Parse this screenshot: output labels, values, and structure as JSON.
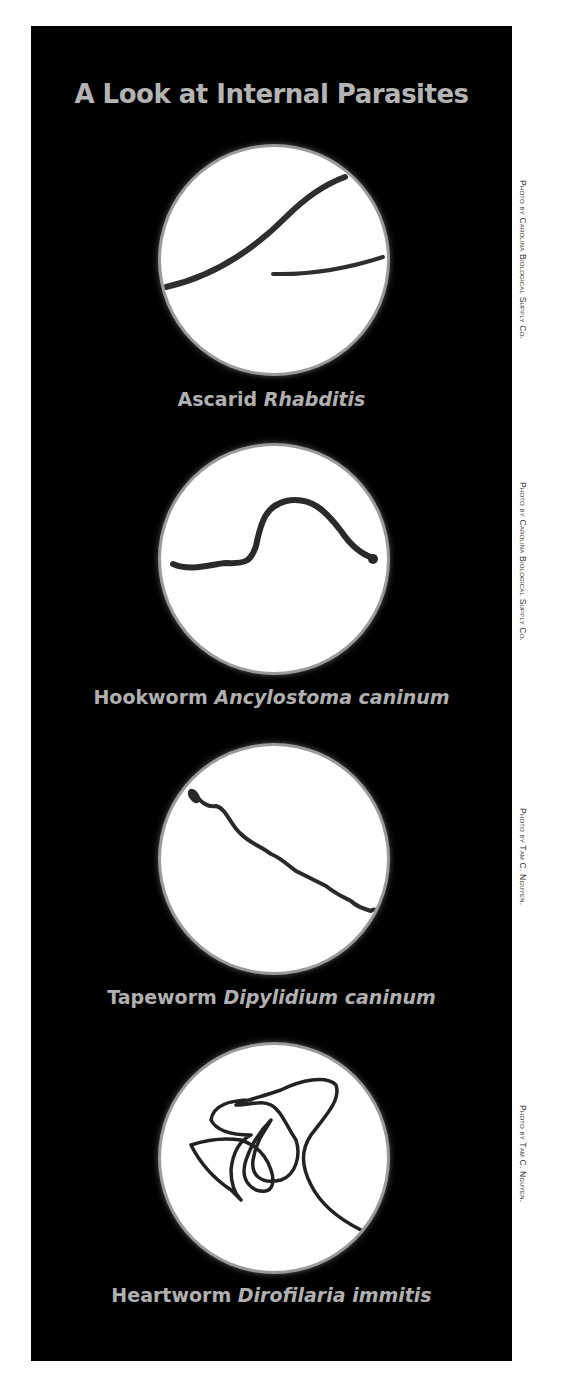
{
  "title": "A Look at Internal Parasites",
  "specimens": [
    {
      "common": "Ascarid",
      "scientific": "Rhabditis",
      "credit": "Photo by Carolina Biological Supply Co."
    },
    {
      "common": "Hookworm",
      "scientific": "Ancylostoma caninum",
      "credit": "Photo by Carolina Biological Supply Co."
    },
    {
      "common": "Tapeworm",
      "scientific": "Dipylidium caninum",
      "credit": "Photo by Tam C. Nguyen."
    },
    {
      "common": "Heartworm",
      "scientific": "Dirofilaria immitis",
      "credit": "Photo by Tam C. Nguyen."
    }
  ],
  "colors": {
    "panel": "#000000",
    "text": "#b4b4b4",
    "circle": "#ffffff",
    "worm": "#2a2a2a"
  }
}
